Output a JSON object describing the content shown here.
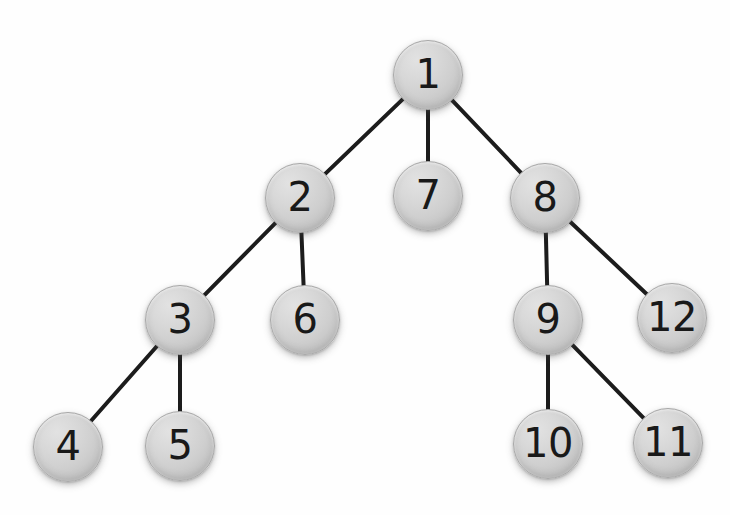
{
  "diagram": {
    "type": "rooted-tree",
    "background_color": "#fefefe",
    "node_fill_color": "#d2d2d2",
    "node_border_color": "#a8a8a8",
    "node_label_color": "#191919",
    "edge_color": "#1c1c1c",
    "edge_width": 4,
    "node_diameter": 70,
    "node_font_size": 40,
    "nodes": [
      {
        "id": "1",
        "label": "1",
        "cx": 428,
        "cy": 75,
        "r": 35
      },
      {
        "id": "2",
        "label": "2",
        "cx": 300,
        "cy": 198,
        "r": 35
      },
      {
        "id": "3",
        "label": "3",
        "cx": 180,
        "cy": 320,
        "r": 35
      },
      {
        "id": "4",
        "label": "4",
        "cx": 68,
        "cy": 447,
        "r": 35
      },
      {
        "id": "5",
        "label": "5",
        "cx": 180,
        "cy": 446,
        "r": 35
      },
      {
        "id": "6",
        "label": "6",
        "cx": 305,
        "cy": 320,
        "r": 35
      },
      {
        "id": "7",
        "label": "7",
        "cx": 428,
        "cy": 196,
        "r": 35
      },
      {
        "id": "8",
        "label": "8",
        "cx": 545,
        "cy": 198,
        "r": 35
      },
      {
        "id": "9",
        "label": "9",
        "cx": 548,
        "cy": 320,
        "r": 35
      },
      {
        "id": "10",
        "label": "10",
        "cx": 548,
        "cy": 444,
        "r": 35
      },
      {
        "id": "11",
        "label": "11",
        "cx": 668,
        "cy": 443,
        "r": 35
      },
      {
        "id": "12",
        "label": "12",
        "cx": 672,
        "cy": 318,
        "r": 35
      }
    ],
    "edges": [
      {
        "from": "1",
        "to": "2"
      },
      {
        "from": "1",
        "to": "7"
      },
      {
        "from": "1",
        "to": "8"
      },
      {
        "from": "2",
        "to": "3"
      },
      {
        "from": "2",
        "to": "6"
      },
      {
        "from": "3",
        "to": "4"
      },
      {
        "from": "3",
        "to": "5"
      },
      {
        "from": "8",
        "to": "9"
      },
      {
        "from": "8",
        "to": "12"
      },
      {
        "from": "9",
        "to": "10"
      },
      {
        "from": "9",
        "to": "11"
      }
    ]
  }
}
